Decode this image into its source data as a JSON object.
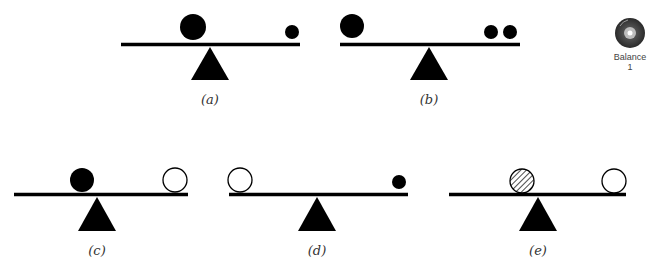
{
  "figure": {
    "panels": [
      {
        "id": "a",
        "label": "(a)",
        "beam": {
          "x1": 121,
          "x2": 300,
          "y": 44.5
        },
        "fulcrum": {
          "apex_x": 210,
          "apex_y": 47,
          "base_y": 80,
          "half_width": 19
        },
        "label_pos": {
          "x": 210,
          "y": 104
        },
        "objects": [
          {
            "type": "solid",
            "cx": 193,
            "cy": 27,
            "r": 13
          },
          {
            "type": "solid",
            "cx": 292,
            "cy": 32,
            "r": 7
          }
        ]
      },
      {
        "id": "b",
        "label": "(b)",
        "beam": {
          "x1": 340,
          "x2": 520,
          "y": 44.5
        },
        "fulcrum": {
          "apex_x": 429,
          "apex_y": 47,
          "base_y": 80,
          "half_width": 19
        },
        "label_pos": {
          "x": 429,
          "y": 104
        },
        "objects": [
          {
            "type": "solid",
            "cx": 352,
            "cy": 26,
            "r": 12
          },
          {
            "type": "solid",
            "cx": 491,
            "cy": 32,
            "r": 7
          },
          {
            "type": "solid",
            "cx": 510,
            "cy": 32,
            "r": 7
          }
        ]
      },
      {
        "id": "c",
        "label": "(c)",
        "beam": {
          "x1": 14,
          "x2": 188,
          "y": 194.5
        },
        "fulcrum": {
          "apex_x": 97,
          "apex_y": 197,
          "base_y": 231,
          "half_width": 19
        },
        "label_pos": {
          "x": 97,
          "y": 255
        },
        "objects": [
          {
            "type": "solid",
            "cx": 82,
            "cy": 180,
            "r": 12
          },
          {
            "type": "open",
            "cx": 175,
            "cy": 180,
            "r": 12
          }
        ]
      },
      {
        "id": "d",
        "label": "(d)",
        "beam": {
          "x1": 229,
          "x2": 408,
          "y": 194.5
        },
        "fulcrum": {
          "apex_x": 317,
          "apex_y": 197,
          "base_y": 231,
          "half_width": 19
        },
        "label_pos": {
          "x": 317,
          "y": 255
        },
        "objects": [
          {
            "type": "open",
            "cx": 240,
            "cy": 180,
            "r": 12
          },
          {
            "type": "solid",
            "cx": 399,
            "cy": 182,
            "r": 7
          }
        ]
      },
      {
        "id": "e",
        "label": "(e)",
        "beam": {
          "x1": 449,
          "x2": 626,
          "y": 194.5
        },
        "fulcrum": {
          "apex_x": 538,
          "apex_y": 197,
          "base_y": 231,
          "half_width": 19
        },
        "label_pos": {
          "x": 538,
          "y": 255
        },
        "objects": [
          {
            "type": "hatched",
            "cx": 522,
            "cy": 181,
            "r": 12
          },
          {
            "type": "open",
            "cx": 614,
            "cy": 181,
            "r": 12
          }
        ]
      }
    ]
  },
  "media_icon": {
    "icon": "cd-disc-icon",
    "title": "Balance",
    "number": "1"
  },
  "colors": {
    "ink": "#000000",
    "background": "#ffffff",
    "disc_outer": "#4a4a4a",
    "disc_inner": "#bdbdbd"
  }
}
